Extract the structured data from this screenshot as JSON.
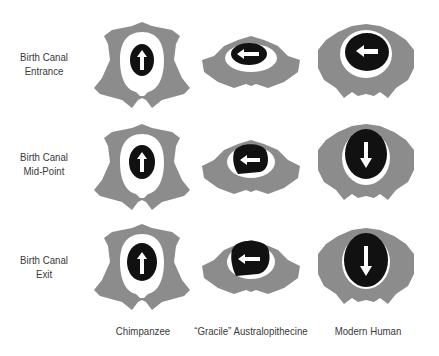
{
  "rows": [
    {
      "label_line1": "Birth Canal",
      "label_line2": "Entrance"
    },
    {
      "label_line1": "Birth Canal",
      "label_line2": "Mid-Point"
    },
    {
      "label_line1": "Birth Canal",
      "label_line2": "Exit"
    }
  ],
  "columns": [
    {
      "label": "Chimpanzee"
    },
    {
      "label": "“Gracile” Australopithecine"
    },
    {
      "label": "Modern Human"
    }
  ],
  "colors": {
    "bone": "#8c8c8c",
    "canal": "#ffffff",
    "head": "#111111",
    "arrow": "#ffffff"
  },
  "arrows": [
    [
      "up-arrow",
      "left-arrow",
      "left-arrow"
    ],
    [
      "up-arrow",
      "left-arrow",
      "down-arrow"
    ],
    [
      "up-arrow",
      "left-arrow",
      "down-arrow"
    ]
  ]
}
